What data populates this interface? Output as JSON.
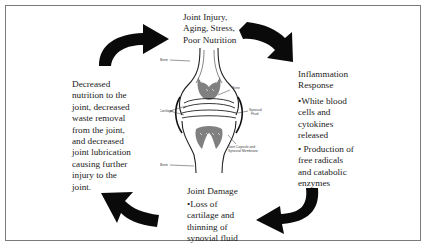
{
  "diagram": {
    "stages": {
      "top": {
        "text": "Joint Injury,\nAging, Stress,\nPoor Nutrition"
      },
      "right": {
        "title": "Inflammation\nResponse",
        "bullets": [
          "•White blood\ncells and\ncytokines\nreleased",
          "• Production of\nfree radicals\nand catabolic\nenzymes"
        ]
      },
      "bottom": {
        "title": "Joint Damage",
        "bullets": [
          "•Loss of\ncartilage and\nthinning of\nsynovial fluid"
        ]
      },
      "left": {
        "text": "Decreased\nnutrition to the\njoint, decreased\nwaste removal\nfrom the joint,\nand decreased\njoint lubrication\ncausing further\ninjury to the\njoint."
      }
    },
    "illustration": {
      "labels": {
        "bone_top": "Bone",
        "bone_inner": "Bone",
        "cartilage": "Cartilage",
        "synovial_fluid": "Synovial\nFluid",
        "capsule": "Joint Capsule and\nSynovial Membrane",
        "bone_bottom": "Bone"
      }
    },
    "arrows": [
      {
        "name": "arrow-left-to-top",
        "direction": "clockwise"
      },
      {
        "name": "arrow-top-to-right",
        "direction": "clockwise"
      },
      {
        "name": "arrow-right-to-bottom",
        "direction": "clockwise"
      },
      {
        "name": "arrow-bottom-to-left",
        "direction": "clockwise"
      }
    ],
    "colors": {
      "arrow": "#0a0a0a",
      "frame": "#7a7a7a",
      "text": "#222222"
    }
  }
}
